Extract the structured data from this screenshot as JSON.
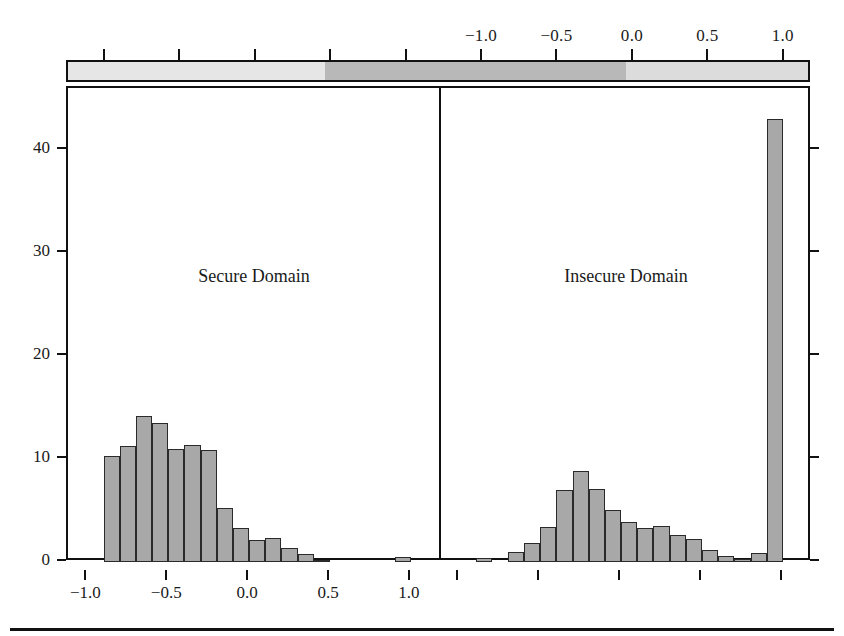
{
  "chart_data": {
    "type": "bar",
    "title": "",
    "subtitle": "",
    "xlabel": "",
    "ylabel": "",
    "grid": false,
    "legend_position": "none",
    "ylim": [
      0,
      46
    ],
    "yticks": [
      0,
      10,
      20,
      30,
      40
    ],
    "ytick_labels": [
      "0",
      "10",
      "20",
      "30",
      "40"
    ],
    "panels": [
      {
        "name": "secure-domain",
        "title": "Secure Domain",
        "xlim": [
          -1.12,
          1.18
        ],
        "xticks": [
          -1.0,
          -0.5,
          0.0,
          0.5,
          1.0
        ],
        "xtick_labels": [
          "−1.0",
          "−0.5",
          "0.0",
          "0.5",
          "1.0"
        ],
        "bin_width": 0.1,
        "bins": [
          {
            "x0": -0.9,
            "x1": -0.8,
            "count": 10.3
          },
          {
            "x0": -0.8,
            "x1": -0.7,
            "count": 11.3
          },
          {
            "x0": -0.7,
            "x1": -0.6,
            "count": 14.2
          },
          {
            "x0": -0.6,
            "x1": -0.5,
            "count": 13.5
          },
          {
            "x0": -0.5,
            "x1": -0.4,
            "count": 11.0
          },
          {
            "x0": -0.4,
            "x1": -0.3,
            "count": 11.4
          },
          {
            "x0": -0.3,
            "x1": -0.2,
            "count": 10.9
          },
          {
            "x0": -0.2,
            "x1": -0.1,
            "count": 5.2
          },
          {
            "x0": -0.1,
            "x1": 0.0,
            "count": 3.3
          },
          {
            "x0": 0.0,
            "x1": 0.1,
            "count": 2.1
          },
          {
            "x0": 0.1,
            "x1": 0.2,
            "count": 2.3
          },
          {
            "x0": 0.2,
            "x1": 0.3,
            "count": 1.4
          },
          {
            "x0": 0.3,
            "x1": 0.4,
            "count": 0.8
          },
          {
            "x0": 0.4,
            "x1": 0.5,
            "count": 0.2
          },
          {
            "x0": 0.9,
            "x1": 1.0,
            "count": 0.5
          }
        ]
      },
      {
        "name": "insecure-domain",
        "title": "Insecure Domain",
        "xlim": [
          -1.12,
          1.18
        ],
        "xticks": [
          -1.0,
          -0.5,
          0.0,
          0.5,
          1.0
        ],
        "xtick_labels": [
          "",
          "",
          "",
          "",
          ""
        ],
        "bin_width": 0.1,
        "bins": [
          {
            "x0": -0.9,
            "x1": -0.8,
            "count": 0.4
          },
          {
            "x0": -0.7,
            "x1": -0.6,
            "count": 1.0
          },
          {
            "x0": -0.6,
            "x1": -0.5,
            "count": 1.8
          },
          {
            "x0": -0.5,
            "x1": -0.4,
            "count": 3.4
          },
          {
            "x0": -0.4,
            "x1": -0.3,
            "count": 7.0
          },
          {
            "x0": -0.3,
            "x1": -0.2,
            "count": 8.8
          },
          {
            "x0": -0.2,
            "x1": -0.1,
            "count": 7.1
          },
          {
            "x0": -0.1,
            "x1": 0.0,
            "count": 5.0
          },
          {
            "x0": 0.0,
            "x1": 0.1,
            "count": 3.9
          },
          {
            "x0": 0.1,
            "x1": 0.2,
            "count": 3.3
          },
          {
            "x0": 0.2,
            "x1": 0.3,
            "count": 3.5
          },
          {
            "x0": 0.3,
            "x1": 0.4,
            "count": 2.6
          },
          {
            "x0": 0.4,
            "x1": 0.5,
            "count": 2.2
          },
          {
            "x0": 0.5,
            "x1": 0.6,
            "count": 1.2
          },
          {
            "x0": 0.6,
            "x1": 0.7,
            "count": 0.6
          },
          {
            "x0": 0.7,
            "x1": 0.8,
            "count": 0.3
          },
          {
            "x0": 0.8,
            "x1": 0.9,
            "count": 0.9
          },
          {
            "x0": 0.9,
            "x1": 1.0,
            "count": 43.0
          }
        ]
      }
    ],
    "top_axis": {
      "name": "correlation-scale",
      "labels": [
        "−1.0",
        "−0.5",
        "0.0",
        "0.5",
        "1.0"
      ],
      "tick_values": [
        -1.0,
        -0.5,
        0.0,
        0.5,
        1.0
      ],
      "unlabeled_tick_values": [
        -3.5,
        -3.0,
        -2.5,
        -2.0,
        -1.5
      ],
      "range": [
        -3.75,
        1.18
      ],
      "colour_bands": [
        {
          "from": -3.75,
          "to": -2.05,
          "colour": "#e6e6e6"
        },
        {
          "from": -2.05,
          "to": -0.05,
          "colour": "#b8b8b8"
        },
        {
          "from": -0.05,
          "to": 1.18,
          "colour": "#dcdcdc"
        }
      ]
    },
    "colors": {
      "bar_fill": "#a8a8a8",
      "bar_edge": "#2a2a2a",
      "axis": "#111111",
      "background": "#ffffff"
    }
  }
}
